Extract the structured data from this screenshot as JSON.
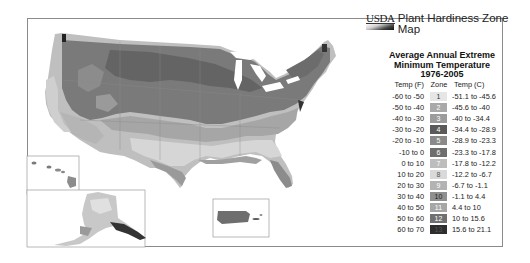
{
  "header": {
    "agency": "USDA",
    "title": "Plant Hardiness Zone Map"
  },
  "subtitle": {
    "line1": "Average Annual Extreme",
    "line2": "Minimum Temperature",
    "line3": "1976-2005"
  },
  "legend": {
    "col_f": "Temp (F)",
    "col_zone": "Zone",
    "col_c": "Temp (C)",
    "rows": [
      {
        "f": "-60 to -50",
        "zone": "1",
        "c": "-51.1 to -45.6",
        "color": "#e6e6e6",
        "text": "#333"
      },
      {
        "f": "-50 to -40",
        "zone": "2",
        "c": "-45.6 to -40",
        "color": "#a9a9a9",
        "text": "#fff"
      },
      {
        "f": "-40 to -30",
        "zone": "3",
        "c": "-40 to -34.4",
        "color": "#9c9c9c",
        "text": "#fff"
      },
      {
        "f": "-30 to -20",
        "zone": "4",
        "c": "-34.4 to -28.9",
        "color": "#5a5a5a",
        "text": "#fff"
      },
      {
        "f": "-20 to -10",
        "zone": "5",
        "c": "-28.9 to -23.3",
        "color": "#8a8a8a",
        "text": "#fff"
      },
      {
        "f": "-10 to 0",
        "zone": "6",
        "c": "-23.3 to -17.8",
        "color": "#6e6e6e",
        "text": "#fff"
      },
      {
        "f": "0 to 10",
        "zone": "7",
        "c": "-17.8 to -12.2",
        "color": "#bdbdbd",
        "text": "#fff"
      },
      {
        "f": "10 to 20",
        "zone": "8",
        "c": "-12.2 to -6.7",
        "color": "#d9d9d9",
        "text": "#555"
      },
      {
        "f": "20 to 30",
        "zone": "9",
        "c": "-6.7 to -1.1",
        "color": "#b3b3b3",
        "text": "#fff"
      },
      {
        "f": "30 to 40",
        "zone": "10",
        "c": "-1.1 to 4.4",
        "color": "#8f8f8f",
        "text": "#222"
      },
      {
        "f": "40 to 50",
        "zone": "11",
        "c": "4.4 to 10",
        "color": "#a6a6a6",
        "text": "#fff"
      },
      {
        "f": "50 to 60",
        "zone": "12",
        "c": "10 to 15.6",
        "color": "#707070",
        "text": "#fff"
      },
      {
        "f": "60 to 70",
        "zone": "13",
        "c": "15.6 to 21.1",
        "color": "#2e2e2e",
        "text": "#555"
      }
    ]
  },
  "map": {
    "regions": [
      "Contiguous United States",
      "Hawaii",
      "Alaska",
      "Puerto Rico"
    ]
  }
}
